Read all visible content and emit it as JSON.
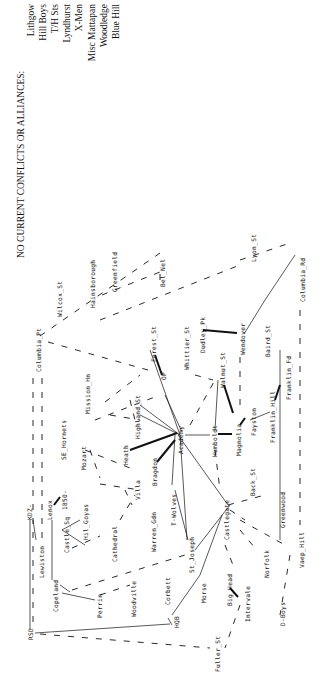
{
  "header": {
    "title": "NO CURRENT CONFLICTS OR ALLIANCES:",
    "groups": [
      "Lithgow",
      "Hill Boys",
      "T/H Sts",
      "Lyndhurst",
      "X-Men",
      "Misc Mattapan",
      "Woodledge",
      "Blue Hill"
    ]
  },
  "nodes": {
    "columbia_pt": "Columbia_Pt",
    "wilcox_st": "Wilcox_St",
    "hainsborough": "Hainsborough",
    "greenfield": "Greenfield",
    "bel_nel": "Bel_Nel",
    "lyon_st": "Lyon_St",
    "columbia_rd": "Columbia_Rd",
    "forest_st": "Forest_St",
    "op": "OP",
    "whittier_st": "Whittier_St",
    "dudley_pk": "Dudley_Pk",
    "wendover": "Wendover",
    "baird_st": "Baird_St",
    "walnut_st": "Walnut_St",
    "franklin_fd": "Franklin_Fd",
    "franklin_hill": "Franklin_Hill",
    "fayston": "Fayston",
    "magnolia": "Magnolia",
    "humboldt": "Humboldt",
    "academy": "Academy",
    "highland_st": "Highland_St",
    "mission_hn": "Mission_Hn",
    "se_hornets": "SE_Hornets",
    "mozart": "Mozart",
    "heath": "Heath",
    "bragdon": "Bragdon",
    "villa": "Villa",
    "kdz": "KDZ-",
    "b850": "1850-",
    "lenox": "Lenox",
    "hil_goyas": "Hil_Goyas",
    "castle_sq": "Castle_Sq",
    "cathedral": "Cathedral",
    "lewiston": "Lewiston",
    "copeland": "Copeland",
    "perrin": "Perrin",
    "woodville": "Woodville",
    "warren_gdn": "Warren_Gdn",
    "t_wolves": "T-Wolves",
    "st_joseph": "St_Joseph",
    "castlegate": "Castlegate",
    "back_st": "Back_St",
    "greenwood": "Greenwood",
    "vaep_hill": "Vaep_Hill",
    "norfolk": "Norfolk",
    "big_head": "Big_Head",
    "intervale": "Intervale",
    "corbett": "Corbett",
    "morse": "Morse",
    "hqb": "HQB",
    "rsd": "RSD",
    "fuller_st": "Fuller_St",
    "d_boys": "D-Boys"
  }
}
